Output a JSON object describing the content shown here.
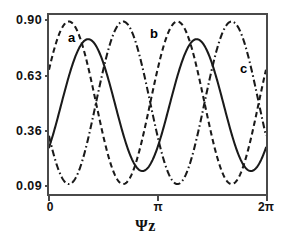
{
  "chart_data": {
    "type": "line",
    "title": "",
    "subtitle": "",
    "xlabel": "Ψz",
    "ylabel": "",
    "xlim": [
      0,
      6.283185307
    ],
    "ylim": [
      0.0405,
      0.9325
    ],
    "grid": false,
    "legend_position": "inline-annotations",
    "x_ticks": [
      {
        "value": 0,
        "label": "0"
      },
      {
        "value": 3.141592653,
        "label": "π"
      },
      {
        "value": 6.283185307,
        "label": "2π"
      }
    ],
    "y_ticks": [
      {
        "value": 0.9,
        "label": "0.90"
      },
      {
        "value": 0.63,
        "label": "0.63"
      },
      {
        "value": 0.36,
        "label": "0.36"
      },
      {
        "value": 0.09,
        "label": "0.09"
      }
    ],
    "annotations": [
      {
        "text": "a",
        "x": 0.69,
        "y": 0.8,
        "series": "a"
      },
      {
        "text": "b",
        "x": 2.95,
        "y": 0.82,
        "series": "b"
      },
      {
        "text": "c",
        "x": 5.52,
        "y": 0.68,
        "series": "c"
      }
    ],
    "series": [
      {
        "name": "a",
        "label": "a",
        "style": "dashed",
        "color": "#1a1a1a",
        "period": 3.141592653,
        "min": 0.09,
        "max": 0.9,
        "phase_deg": -66,
        "x": [
          0.0,
          0.126,
          0.251,
          0.377,
          0.503,
          0.628,
          0.754,
          0.88,
          1.005,
          1.131,
          1.257,
          1.382,
          1.508,
          1.634,
          1.759,
          1.885,
          2.011,
          2.136,
          2.262,
          2.388,
          2.513,
          2.639,
          2.765,
          2.89,
          3.016,
          3.142,
          3.267,
          3.393,
          3.519,
          3.644,
          3.77,
          3.896,
          4.021,
          4.147,
          4.273,
          4.398,
          4.524,
          4.65,
          4.775,
          4.901,
          5.027,
          5.152,
          5.278,
          5.404,
          5.529,
          5.655,
          5.781,
          5.906,
          6.032,
          6.158,
          6.283
        ],
        "y": [
          0.495,
          0.647,
          0.773,
          0.859,
          0.898,
          0.888,
          0.83,
          0.733,
          0.612,
          0.485,
          0.369,
          0.243,
          0.158,
          0.111,
          0.109,
          0.152,
          0.236,
          0.35,
          0.477,
          0.603,
          0.72,
          0.814,
          0.877,
          0.9,
          0.882,
          0.823,
          0.729,
          0.609,
          0.481,
          0.358,
          0.239,
          0.156,
          0.11,
          0.109,
          0.154,
          0.239,
          0.353,
          0.481,
          0.607,
          0.723,
          0.816,
          0.878,
          0.9,
          0.881,
          0.821,
          0.726,
          0.605,
          0.477,
          0.355,
          0.237,
          0.495
        ]
      },
      {
        "name": "b",
        "label": "b",
        "style": "dash-dot",
        "color": "#1a1a1a",
        "period": 3.141592653,
        "min": 0.09,
        "max": 0.9,
        "phase_deg": 114,
        "x": [
          0.0,
          0.126,
          0.251,
          0.377,
          0.503,
          0.628,
          0.754,
          0.88,
          1.005,
          1.131,
          1.257,
          1.382,
          1.508,
          1.634,
          1.759,
          1.885,
          2.011,
          2.136,
          2.262,
          2.388,
          2.513,
          2.639,
          2.765,
          2.89,
          3.016,
          3.142,
          3.267,
          3.393,
          3.519,
          3.644,
          3.77,
          3.896,
          4.021,
          4.147,
          4.273,
          4.398,
          4.524,
          4.65,
          4.775,
          4.901,
          5.027,
          5.152,
          5.278,
          5.404,
          5.529,
          5.655,
          5.781,
          5.906,
          6.032,
          6.158,
          6.283
        ],
        "y": [
          0.495,
          0.352,
          0.228,
          0.142,
          0.106,
          0.118,
          0.176,
          0.274,
          0.392,
          0.518,
          0.641,
          0.747,
          0.831,
          0.884,
          0.897,
          0.855,
          0.77,
          0.656,
          0.523,
          0.396,
          0.28,
          0.186,
          0.125,
          0.103,
          0.122,
          0.181,
          0.275,
          0.394,
          0.523,
          0.646,
          0.751,
          0.834,
          0.885,
          0.897,
          0.853,
          0.768,
          0.654,
          0.521,
          0.394,
          0.278,
          0.185,
          0.124,
          0.103,
          0.123,
          0.183,
          0.278,
          0.397,
          0.526,
          0.648,
          0.753,
          0.495
        ]
      },
      {
        "name": "c",
        "label": "c",
        "style": "solid",
        "color": "#1a1a1a",
        "period": 3.141592653,
        "min": 0.155,
        "max": 0.812,
        "phase_deg": -130,
        "x": [
          0.0,
          0.126,
          0.251,
          0.377,
          0.503,
          0.628,
          0.754,
          0.88,
          1.005,
          1.131,
          1.257,
          1.382,
          1.508,
          1.634,
          1.759,
          1.885,
          2.011,
          2.136,
          2.262,
          2.388,
          2.513,
          2.639,
          2.765,
          2.89,
          3.016,
          3.142,
          3.267,
          3.393,
          3.519,
          3.644,
          3.77,
          3.896,
          4.021,
          4.147,
          4.273,
          4.398,
          4.524,
          4.65,
          4.775,
          4.901,
          5.027,
          5.152,
          5.278,
          5.404,
          5.529,
          5.655,
          5.781,
          5.906,
          6.032,
          6.158,
          6.283
        ],
        "y": [
          0.172,
          0.16,
          0.172,
          0.213,
          0.28,
          0.367,
          0.463,
          0.559,
          0.65,
          0.725,
          0.78,
          0.809,
          0.81,
          0.782,
          0.73,
          0.657,
          0.568,
          0.473,
          0.377,
          0.289,
          0.22,
          0.177,
          0.161,
          0.175,
          0.219,
          0.287,
          0.375,
          0.471,
          0.566,
          0.655,
          0.729,
          0.783,
          0.81,
          0.809,
          0.778,
          0.724,
          0.648,
          0.557,
          0.461,
          0.365,
          0.279,
          0.212,
          0.171,
          0.159,
          0.173,
          0.217,
          0.285,
          0.372,
          0.468,
          0.563,
          0.172
        ]
      }
    ]
  },
  "axis": {
    "x_title": "Ψz",
    "x_tick_0": "0",
    "x_tick_pi": "π",
    "x_tick_2pi": "2π",
    "y_tick_090": "0.90",
    "y_tick_063": "0.63",
    "y_tick_036": "0.36",
    "y_tick_009": "0.09"
  },
  "labels": {
    "curve_a": "a",
    "curve_b": "b",
    "curve_c": "c"
  },
  "colors": {
    "frame": "#4a4a4a",
    "curve": "#1a1a1a",
    "text": "#111111",
    "background": "#ffffff"
  }
}
